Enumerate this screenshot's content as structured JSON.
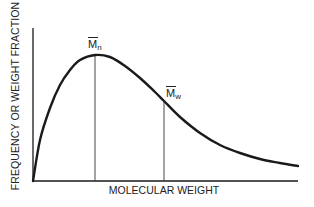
{
  "chart_data": {
    "type": "line",
    "title": "",
    "xlabel": "MOLECULAR WEIGHT",
    "ylabel": "FREQUENCY OR WEIGHT FRACTION",
    "grid": false,
    "legend": null,
    "x_ticks": [],
    "y_ticks": [],
    "series": [
      {
        "name": "molecular weight distribution",
        "description": "skewed distribution rising steeply from origin to a peak, then long tail decaying to the right",
        "points_px": [
          [
            33,
            181
          ],
          [
            40,
            140
          ],
          [
            50,
            108
          ],
          [
            60,
            85
          ],
          [
            70,
            70
          ],
          [
            80,
            60
          ],
          [
            95,
            55
          ],
          [
            110,
            57
          ],
          [
            125,
            66
          ],
          [
            140,
            78
          ],
          [
            155,
            92
          ],
          [
            164,
            101
          ],
          [
            180,
            117
          ],
          [
            200,
            133
          ],
          [
            220,
            145
          ],
          [
            240,
            153
          ],
          [
            260,
            159
          ],
          [
            280,
            163
          ],
          [
            298,
            166
          ]
        ]
      }
    ],
    "annotations": [
      {
        "label": "M",
        "subscript": "n",
        "overbar": true,
        "meaning": "number-average molecular weight",
        "x_px": 95,
        "at_curve_y_px": 55
      },
      {
        "label": "M",
        "subscript": "w",
        "overbar": true,
        "meaning": "weight-average molecular weight",
        "x_px": 164,
        "at_curve_y_px": 101
      }
    ]
  },
  "labels": {
    "xlabel": "MOLECULAR WEIGHT",
    "ylabel": "FREQUENCY OR WEIGHT FRACTION",
    "mn_main": "M",
    "mn_sub": "n",
    "mw_main": "M",
    "mw_sub": "w"
  },
  "colors": {
    "curve": "#1a1a1a",
    "axes": "#1a1a1a",
    "background": "#ffffff"
  }
}
